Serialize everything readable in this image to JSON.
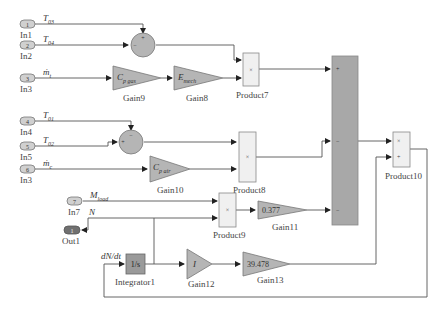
{
  "diagram": {
    "inports": [
      {
        "id": "in1",
        "num": "1",
        "label": "In1",
        "signal": "T",
        "signal_sub": "03"
      },
      {
        "id": "in2",
        "num": "2",
        "label": "In2",
        "signal": "T",
        "signal_sub": "04"
      },
      {
        "id": "in3a",
        "num": "3",
        "label": "In3",
        "signal": "ṁ",
        "signal_sub": "t"
      },
      {
        "id": "in4",
        "num": "4",
        "label": "In4",
        "signal": "T",
        "signal_sub": "01"
      },
      {
        "id": "in5",
        "num": "5",
        "label": "In5",
        "signal": "T",
        "signal_sub": "02"
      },
      {
        "id": "in3b",
        "num": "6",
        "label": "In3",
        "signal": "ṁ",
        "signal_sub": "c"
      },
      {
        "id": "in7",
        "num": "7",
        "label": "In7",
        "signal": "M",
        "signal_sub": "load"
      }
    ],
    "outport": {
      "num": "1",
      "label": "Out1",
      "signal": "N"
    },
    "sums": [
      {
        "id": "sum1",
        "top_sign": "+",
        "left_sign": "−"
      },
      {
        "id": "sum2",
        "top_sign": "−",
        "left_sign": "+"
      }
    ],
    "gains": [
      {
        "id": "gain9",
        "label": "Gain9",
        "value": "C",
        "value_sub": "p gas"
      },
      {
        "id": "gain8",
        "label": "Gain8",
        "value": "E",
        "value_sub": "mech"
      },
      {
        "id": "gain10",
        "label": "Gain10",
        "value": "C",
        "value_sub": "p air"
      },
      {
        "id": "gain11",
        "label": "Gain11",
        "value": "0.377"
      },
      {
        "id": "gain12",
        "label": "Gain12",
        "value": "I"
      },
      {
        "id": "gain13",
        "label": "Gain13",
        "value": "39.478"
      }
    ],
    "products": [
      {
        "id": "product7",
        "label": "Product7",
        "symbol": "×"
      },
      {
        "id": "product8",
        "label": "Product8",
        "symbol": "×"
      },
      {
        "id": "product9",
        "label": "Product9",
        "symbol": "×"
      },
      {
        "id": "product10",
        "label": "Product10",
        "sign1": "×",
        "sign2": "+"
      }
    ],
    "big_sum": {
      "signs": [
        "+",
        "−",
        "−"
      ]
    },
    "integrator": {
      "label": "Integrator1",
      "value": "1/s",
      "input_signal": "dN/dt"
    },
    "colors": {
      "block_fill": "#b5b5b5",
      "dark_block_fill": "#9a9a9a",
      "product_fill": "#f0f0f0",
      "wire": "#555555"
    }
  }
}
